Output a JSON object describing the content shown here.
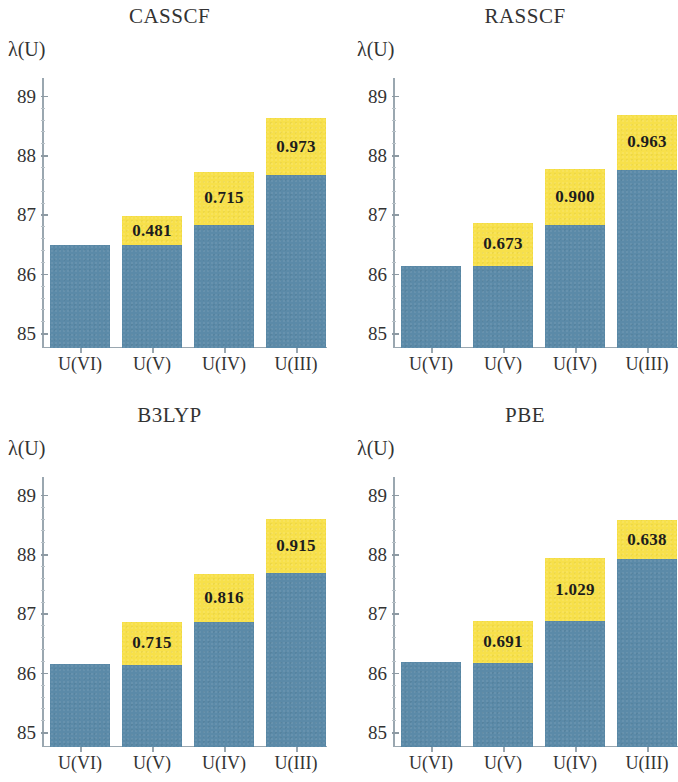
{
  "figure": {
    "panels": [
      {
        "title": "CASSCF",
        "ylabel": "λ(U)",
        "chart_data": {
          "type": "bar",
          "title": "CASSCF",
          "xlabel": "",
          "ylabel": "λ(U)",
          "ylim": [
            84.75,
            89.3
          ],
          "yticks": [
            85,
            86,
            87,
            88,
            89
          ],
          "ytick_labels": [
            "85",
            "86",
            "87",
            "88",
            "89"
          ],
          "grid": false,
          "legend": "none",
          "categories": [
            "U(VI)",
            "U(V)",
            "U(IV)",
            "U(III)"
          ],
          "series": [
            {
              "name": "base",
              "values": [
                86.48,
                86.49,
                86.82,
                87.66
              ]
            },
            {
              "name": "top",
              "values": [
                86.48,
                86.97,
                87.72,
                88.63
              ]
            }
          ],
          "annotations": [
            "",
            "0.481",
            "0.715",
            "0.973"
          ]
        }
      },
      {
        "title": "RASSCF",
        "ylabel": "λ(U)",
        "chart_data": {
          "type": "bar",
          "title": "RASSCF",
          "xlabel": "",
          "ylabel": "λ(U)",
          "ylim": [
            84.75,
            89.3
          ],
          "yticks": [
            85,
            86,
            87,
            88,
            89
          ],
          "ytick_labels": [
            "85",
            "86",
            "87",
            "88",
            "89"
          ],
          "grid": false,
          "legend": "none",
          "categories": [
            "U(VI)",
            "U(V)",
            "U(IV)",
            "U(III)"
          ],
          "series": [
            {
              "name": "base",
              "values": [
                86.14,
                86.14,
                86.82,
                87.75
              ]
            },
            {
              "name": "top",
              "values": [
                86.14,
                86.85,
                87.76,
                88.68
              ]
            }
          ],
          "annotations": [
            "",
            "0.673",
            "0.900",
            "0.963"
          ]
        }
      },
      {
        "title": "B3LYP",
        "ylabel": "λ(U)",
        "chart_data": {
          "type": "bar",
          "title": "B3LYP",
          "xlabel": "",
          "ylabel": "λ(U)",
          "ylim": [
            84.75,
            89.3
          ],
          "yticks": [
            85,
            86,
            87,
            88,
            89
          ],
          "ytick_labels": [
            "85",
            "86",
            "87",
            "88",
            "89"
          ],
          "grid": false,
          "legend": "none",
          "categories": [
            "U(VI)",
            "U(V)",
            "U(IV)",
            "U(III)"
          ],
          "series": [
            {
              "name": "base",
              "values": [
                86.15,
                86.14,
                86.85,
                87.68
              ]
            },
            {
              "name": "top",
              "values": [
                86.15,
                86.86,
                87.67,
                88.6
              ]
            }
          ],
          "annotations": [
            "",
            "0.715",
            "0.816",
            "0.915"
          ]
        }
      },
      {
        "title": "PBE",
        "ylabel": "λ(U)",
        "chart_data": {
          "type": "bar",
          "title": "PBE",
          "xlabel": "",
          "ylabel": "λ(U)",
          "ylim": [
            84.75,
            89.3
          ],
          "yticks": [
            85,
            86,
            87,
            88,
            89
          ],
          "ytick_labels": [
            "85",
            "86",
            "87",
            "88",
            "89"
          ],
          "grid": false,
          "legend": "none",
          "categories": [
            "U(VI)",
            "U(V)",
            "U(IV)",
            "U(III)"
          ],
          "series": [
            {
              "name": "base",
              "values": [
                86.18,
                86.17,
                86.87,
                87.92
              ]
            },
            {
              "name": "top",
              "values": [
                86.18,
                86.87,
                87.93,
                88.57
              ]
            }
          ],
          "annotations": [
            "",
            "0.691",
            "1.029",
            "0.638"
          ]
        }
      }
    ],
    "colors": {
      "bar_base": "#5b8aa8",
      "bar_top": "#f7e04a",
      "axis": "#9aa7b0",
      "text": "#333333",
      "background": "#ffffff"
    }
  }
}
